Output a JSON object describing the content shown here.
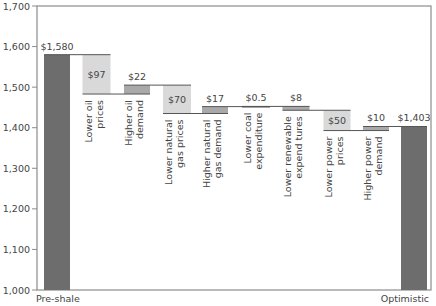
{
  "chart_data": {
    "type": "waterfall",
    "title": "",
    "xlabel": "",
    "ylabel": "",
    "ylim": [
      1000,
      1700
    ],
    "yticks": [
      "1,000",
      "1,100",
      "1,200",
      "1,300",
      "1,400",
      "1,500",
      "1,600",
      "1,700"
    ],
    "grid": false,
    "colors": {
      "total": "#6d6d6d",
      "decrease": "#d9d9d9",
      "increase": "#a9a9a9",
      "axis": "#8c8c8c",
      "connector": "#555555"
    },
    "steps": [
      {
        "label": "Pre-shale",
        "kind": "total",
        "start": 0,
        "end": 1580,
        "value_label": "$1,580"
      },
      {
        "label": "Lower oil prices",
        "lines": [
          "Lower oil",
          "prices"
        ],
        "kind": "decrease",
        "start": 1580,
        "end": 1483,
        "value_label": "$97"
      },
      {
        "label": "Higher oil demand",
        "lines": [
          "Higher oil",
          "demand"
        ],
        "kind": "increase",
        "start": 1483,
        "end": 1505,
        "value_label": "$22"
      },
      {
        "label": "Lower natural gas prices",
        "lines": [
          "Lower natural",
          "gas prices"
        ],
        "kind": "decrease",
        "start": 1505,
        "end": 1435,
        "value_label": "$70"
      },
      {
        "label": "Higher natural gas demand",
        "lines": [
          "Higher natural",
          "gas demand"
        ],
        "kind": "increase",
        "start": 1435,
        "end": 1452,
        "value_label": "$17"
      },
      {
        "label": "Lower coal expenditure",
        "lines": [
          "Lower coal",
          "expenditure"
        ],
        "kind": "increase",
        "start": 1452,
        "end": 1452.5,
        "value_label": "$0.5"
      },
      {
        "label": "Lower renewable expend tures",
        "lines": [
          "Lower renewable",
          "expend tures"
        ],
        "kind": "increase",
        "start": 1452.5,
        "end": 1443,
        "value_label": "$8"
      },
      {
        "label": "Lower power prices",
        "lines": [
          "Lower power",
          "prices"
        ],
        "kind": "decrease",
        "start": 1443,
        "end": 1393,
        "value_label": "$50"
      },
      {
        "label": "Higher power demand",
        "lines": [
          "Higher power",
          "demand"
        ],
        "kind": "increase",
        "start": 1393,
        "end": 1403,
        "value_label": "$10"
      },
      {
        "label": "Optimistic",
        "kind": "total",
        "start": 0,
        "end": 1403,
        "value_label": "$1,403"
      }
    ]
  }
}
